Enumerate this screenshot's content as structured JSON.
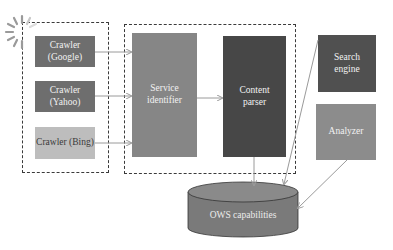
{
  "diagram": {
    "groups": [
      {
        "id": "crawlers-group",
        "style": "dashed"
      },
      {
        "id": "processing-group",
        "style": "dashed"
      }
    ],
    "nodes": {
      "crawler_google": {
        "label": "Crawler\n(Google)",
        "color": "#6e6e6e"
      },
      "crawler_yahoo": {
        "label": "Crawler\n(Yahoo)",
        "color": "#6e6e6e"
      },
      "crawler_bing": {
        "label": "Crawler (Bing)",
        "color": "#bdbdbd",
        "text_color": "#3a3a3a"
      },
      "service_identifier": {
        "label": "Service\nidentifier",
        "color": "#868686"
      },
      "content_parser": {
        "label": "Content\nparser",
        "color": "#474747"
      },
      "search_engine": {
        "label": "Search\nengine",
        "color": "#505050"
      },
      "analyzer": {
        "label": "Analyzer",
        "color": "#8c8c8c"
      },
      "ows_capabilities": {
        "label": "OWS capabilities",
        "shape": "cylinder",
        "color": "#7a7a7a"
      }
    },
    "edges": [
      {
        "from": "crawler_google",
        "to": "service_identifier"
      },
      {
        "from": "crawler_yahoo",
        "to": "service_identifier"
      },
      {
        "from": "crawler_bing",
        "to": "service_identifier"
      },
      {
        "from": "service_identifier",
        "to": "content_parser"
      },
      {
        "from": "content_parser",
        "to": "ows_capabilities"
      },
      {
        "from": "search_engine",
        "to": "ows_capabilities"
      },
      {
        "from": "analyzer",
        "to": "ows_capabilities"
      }
    ],
    "icons": {
      "spinner": "web-crawl-spinner-icon"
    }
  }
}
